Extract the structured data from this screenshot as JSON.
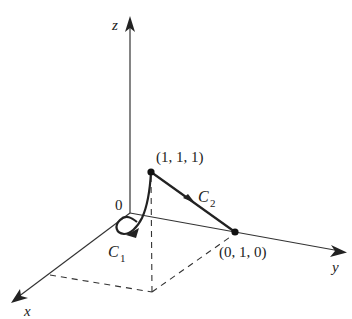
{
  "diagram": {
    "axes": {
      "x_label": "x",
      "y_label": "y",
      "z_label": "z",
      "origin_label": "0"
    },
    "points": [
      {
        "label": "(1, 1, 1)"
      },
      {
        "label": "(0, 1, 0)"
      }
    ],
    "curves": {
      "c1": {
        "letter": "C",
        "sub": "1"
      },
      "c2": {
        "letter": "C",
        "sub": "2"
      }
    },
    "colors": {
      "axis": "#333333",
      "curve": "#222222",
      "dashed": "#333333"
    }
  }
}
